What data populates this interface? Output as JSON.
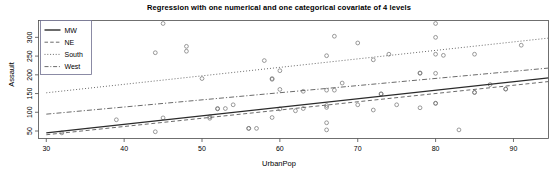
{
  "chart_data": {
    "type": "scatter",
    "title": "Regression with one numerical and one categorical covariate of 4 levels",
    "xlabel": "UrbanPop",
    "ylabel": "Assault",
    "xlim": [
      29,
      94.5
    ],
    "ylim": [
      30,
      345
    ],
    "xticks": [
      30,
      40,
      50,
      60,
      70,
      80,
      90
    ],
    "yticks": [
      50,
      100,
      150,
      200,
      250,
      300
    ],
    "grid": false,
    "legend_position": "top-left",
    "legend_entries": [
      {
        "label": "MW",
        "dash": "solid"
      },
      {
        "label": "NE",
        "dash": "dashed"
      },
      {
        "label": "South",
        "dash": "dotted"
      },
      {
        "label": "West",
        "dash": "dashdot"
      }
    ],
    "series": [
      {
        "name": "MW",
        "dash": "solid",
        "line": {
          "x": [
            30,
            94.5
          ],
          "y": [
            45,
            192
          ]
        },
        "points": [
          [
            32,
            45
          ],
          [
            39,
            80
          ],
          [
            44,
            48
          ],
          [
            45,
            85
          ],
          [
            51,
            88
          ],
          [
            51,
            84
          ],
          [
            52,
            109
          ],
          [
            53,
            110
          ],
          [
            54,
            120
          ],
          [
            56,
            57
          ],
          [
            57,
            57
          ],
          [
            59,
            86
          ],
          [
            60,
            109
          ],
          [
            62,
            104
          ],
          [
            63,
            110
          ],
          [
            66,
            113
          ],
          [
            66,
            118
          ],
          [
            66,
            72
          ],
          [
            66,
            53
          ],
          [
            70,
            120
          ],
          [
            72,
            106
          ],
          [
            73,
            149
          ],
          [
            75,
            120
          ],
          [
            78,
            112
          ],
          [
            80,
            124
          ],
          [
            83,
            53
          ],
          [
            85,
            153
          ],
          [
            87,
            174
          ],
          [
            89,
            162
          ]
        ]
      },
      {
        "name": "NE",
        "dash": "dashed",
        "line": {
          "x": [
            30,
            94.5
          ],
          "y": [
            40,
            182
          ]
        },
        "points": [
          [
            52,
            110
          ],
          [
            56,
            57
          ],
          [
            67,
            159
          ],
          [
            73,
            149
          ],
          [
            78,
            205
          ],
          [
            80,
            124
          ],
          [
            85,
            153
          ],
          [
            89,
            162
          ]
        ]
      },
      {
        "name": "South",
        "dash": "dotted",
        "line": {
          "x": [
            30,
            94.5
          ],
          "y": [
            152,
            298
          ]
        },
        "points": [
          [
            44,
            259
          ],
          [
            45,
            337
          ],
          [
            48,
            276
          ],
          [
            48,
            263
          ],
          [
            50,
            190
          ],
          [
            58,
            238
          ],
          [
            59,
            190
          ],
          [
            60,
            211
          ],
          [
            63,
            156
          ],
          [
            66,
            251
          ],
          [
            67,
            303
          ],
          [
            70,
            285
          ],
          [
            72,
            240
          ],
          [
            74,
            255
          ],
          [
            80,
            337
          ],
          [
            80,
            300
          ],
          [
            80,
            255
          ],
          [
            81,
            252
          ],
          [
            85,
            255
          ],
          [
            91,
            279
          ]
        ]
      },
      {
        "name": "West",
        "dash": "dashdot",
        "line": {
          "x": [
            30,
            94.5
          ],
          "y": [
            95,
            218
          ]
        },
        "points": [
          [
            59,
            188
          ],
          [
            60,
            161
          ],
          [
            66,
            159
          ],
          [
            68,
            178
          ],
          [
            78,
            204
          ],
          [
            80,
            204
          ]
        ]
      }
    ]
  }
}
